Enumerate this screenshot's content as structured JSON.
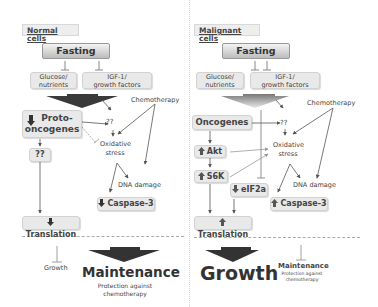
{
  "diagram": {
    "colors": {
      "box_fill": "#e9e9e9",
      "arrow_dark": "#333333",
      "arrow_light": "#aaaaaa",
      "text": "#3a3a3a"
    },
    "normal": {
      "header": "Normal cells",
      "fasting": "Fasting",
      "glucose": "Glucose/\nnutrients",
      "glucose_l1": "Glucose/",
      "glucose_l2": "nutrients",
      "igf_l1": "IGF-1/",
      "igf_l2": "growth factors",
      "chemotherapy": "Chemotherapy",
      "proto_l1": "Proto-",
      "proto_l2": "oncogenes",
      "proto_icon": "down-arrow-icon",
      "qq1": "??",
      "qq2": "??",
      "oxidative_l1": "Oxidative",
      "oxidative_l2": "stress",
      "dna_damage": "DNA damage",
      "caspase": "Caspase-3",
      "caspase_icon": "down-arrow-icon",
      "translation": "Translation",
      "translation_icon": "down-arrow-icon",
      "growth": "Growth",
      "maintenance": "Maintenance",
      "protection_l1": "Protection against",
      "protection_l2": "chemotherapy"
    },
    "malignant": {
      "header": "Malignant cells",
      "fasting": "Fasting",
      "glucose_l1": "Glucose/",
      "glucose_l2": "nutrients",
      "igf_l1": "IGF-1/",
      "igf_l2": "growth factors",
      "chemotherapy": "Chemotherapy",
      "oncogenes": "Oncogenes",
      "qq": "??",
      "akt": "Akt",
      "akt_icon": "up-arrow-icon",
      "s6k": "S6K",
      "s6k_icon": "up-arrow-icon",
      "eif2a": "eIF2a",
      "eif2a_icon": "down-arrow-icon",
      "oxidative_l1": "Oxidative",
      "oxidative_l2": "stress",
      "dna_damage": "DNA damage",
      "caspase": "Caspase-3",
      "caspase_icon": "up-arrow-icon",
      "translation": "Translation",
      "translation_icon": "up-arrow-icon",
      "growth": "Growth",
      "maintenance": "Maintenance",
      "protection_l1": "Protection against",
      "protection_l2": "chemotherapy"
    }
  }
}
